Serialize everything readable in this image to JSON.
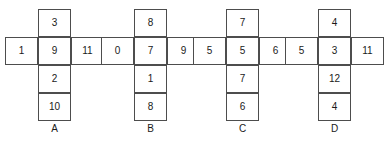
{
  "figure": {
    "nets": [
      {
        "label": "A",
        "column": [
          "3",
          "9",
          "2",
          "10"
        ],
        "left": "1",
        "right": "11"
      },
      {
        "label": "B",
        "column": [
          "8",
          "7",
          "1",
          "8"
        ],
        "left": "0",
        "right": "9"
      },
      {
        "label": "C",
        "column": [
          "7",
          "5",
          "7",
          "6"
        ],
        "left": "5",
        "right": "6"
      },
      {
        "label": "D",
        "column": [
          "4",
          "3",
          "12",
          "4"
        ],
        "left": "5",
        "right": "11"
      }
    ]
  }
}
